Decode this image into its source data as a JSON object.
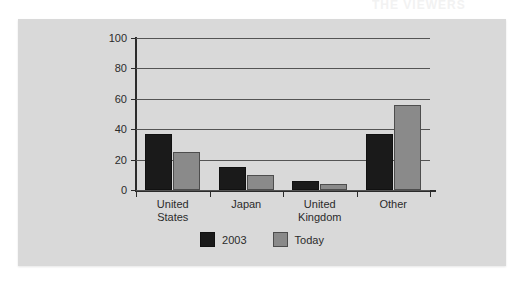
{
  "page": {
    "background_color": "#ffffff",
    "panel_color": "#d9d9d9",
    "top_bleed_text": "THE VIEWERS"
  },
  "chart_data": {
    "type": "bar",
    "title": "",
    "subtitle": "",
    "xlabel": "",
    "ylabel": "",
    "categories": [
      "United States",
      "Japan",
      "United Kingdom",
      "Other"
    ],
    "category_lines": [
      [
        "United",
        "States"
      ],
      [
        "Japan"
      ],
      [
        "United",
        "Kingdom"
      ],
      [
        "Other"
      ]
    ],
    "series": [
      {
        "name": "2003",
        "color": "#1a1a1a",
        "values": [
          37,
          15,
          6,
          37
        ]
      },
      {
        "name": "Today",
        "color": "#8a8a8a",
        "values": [
          25,
          10,
          4,
          56
        ]
      }
    ],
    "ylim": [
      0,
      100
    ],
    "yticks": [
      0,
      20,
      40,
      60,
      80,
      100
    ],
    "ytick_labels": [
      "0",
      "20",
      "40",
      "60",
      "80",
      "100"
    ],
    "grid": true,
    "grid_axis": "y",
    "legend_position": "bottom-center"
  }
}
